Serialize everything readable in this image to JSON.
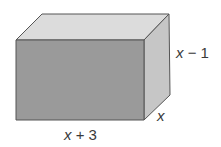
{
  "figure": {
    "type": "rectangular-prism",
    "faces": {
      "front": {
        "color": "#9a9a9a"
      },
      "top": {
        "color": "#dcdcdc"
      },
      "side": {
        "color": "#c6c6c6"
      }
    },
    "edge_color": "#555555",
    "dimensions": {
      "length": {
        "var": "x",
        "op": " + ",
        "num": "3",
        "text": "x + 3"
      },
      "height": {
        "var": "x",
        "op": " − ",
        "num": "1",
        "text": "x − 1"
      },
      "depth": {
        "var": "x",
        "op": "",
        "num": "",
        "text": "x"
      }
    }
  }
}
